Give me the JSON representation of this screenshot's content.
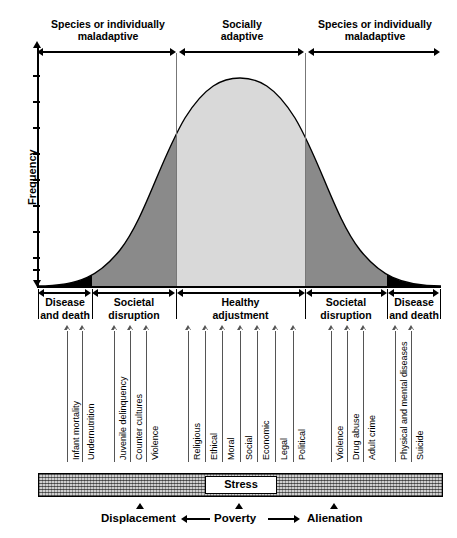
{
  "figure": {
    "y_axis_label": "Frequency",
    "y_tick_count": 9
  },
  "top_regions": [
    {
      "label_line1": "Species or individually",
      "label_line2": "maladaptive",
      "x_start": 38,
      "x_end": 176
    },
    {
      "label_line1": "Socially",
      "label_line2": "adaptive",
      "x_start": 178,
      "x_end": 305
    },
    {
      "label_line1": "Species or individually",
      "label_line2": "maladaptive",
      "x_start": 307,
      "x_end": 441
    }
  ],
  "bottom_bands": [
    {
      "label_line1": "Disease",
      "label_line2": "and death",
      "x_start": 38,
      "x_end": 92,
      "shade": "#000000"
    },
    {
      "label_line1": "Societal",
      "label_line2": "disruption",
      "x_start": 92,
      "x_end": 176,
      "shade": "#8a8a8a"
    },
    {
      "label_line1": "Healthy",
      "label_line2": "adjustment",
      "x_start": 176,
      "x_end": 305,
      "shade": "#d9d9d9"
    },
    {
      "label_line1": "Societal",
      "label_line2": "disruption",
      "x_start": 305,
      "x_end": 387,
      "shade": "#8a8a8a"
    },
    {
      "label_line1": "Disease",
      "label_line2": "and death",
      "x_start": 387,
      "x_end": 441,
      "shade": "#000000"
    }
  ],
  "callouts": {
    "left": [
      {
        "label": "Infant mortality",
        "x": 67,
        "line_top": 331,
        "line_bottom": 462
      },
      {
        "label": "Undernutrition",
        "x": 82,
        "line_top": 331,
        "line_bottom": 462
      },
      {
        "label": "Juvenile delinquency",
        "x": 114,
        "line_top": 331,
        "line_bottom": 462
      },
      {
        "label": "Counter cultures",
        "x": 130,
        "line_top": 331,
        "line_bottom": 462
      },
      {
        "label": "Violence",
        "x": 146,
        "line_top": 331,
        "line_bottom": 462
      }
    ],
    "center": [
      {
        "label": "Religious",
        "x": 188,
        "line_top": 331,
        "line_bottom": 462
      },
      {
        "label": "Ethical",
        "x": 205,
        "line_top": 331,
        "line_bottom": 462
      },
      {
        "label": "Moral",
        "x": 222,
        "line_top": 331,
        "line_bottom": 462
      },
      {
        "label": "Social",
        "x": 240,
        "line_top": 331,
        "line_bottom": 462
      },
      {
        "label": "Economic",
        "x": 257,
        "line_top": 331,
        "line_bottom": 462
      },
      {
        "label": "Legal",
        "x": 275,
        "line_top": 331,
        "line_bottom": 462
      },
      {
        "label": "Political",
        "x": 293,
        "line_top": 331,
        "line_bottom": 462
      }
    ],
    "right": [
      {
        "label": "Violence",
        "x": 331,
        "line_top": 331,
        "line_bottom": 462
      },
      {
        "label": "Drug abuse",
        "x": 347,
        "line_top": 331,
        "line_bottom": 462
      },
      {
        "label": "Adult crime",
        "x": 363,
        "line_top": 331,
        "line_bottom": 462
      },
      {
        "label": "Physical and mental diseases",
        "x": 395,
        "line_top": 331,
        "line_bottom": 462
      },
      {
        "label": "Suicide",
        "x": 411,
        "line_top": 331,
        "line_bottom": 462
      }
    ]
  },
  "stress_bar": {
    "label": "Stress",
    "x_start": 38,
    "x_end": 441
  },
  "bottom_axis": {
    "left_word": "Displacement",
    "center_word": "Poverty",
    "right_word": "Alienation"
  },
  "chart_data": {
    "type": "area",
    "title": "",
    "xlabel": "",
    "ylabel": "Frequency",
    "distribution": "normal bell curve",
    "peak_x": 240,
    "curve_shading_boundaries": [
      38,
      92,
      176,
      305,
      387,
      441
    ],
    "shade_colors": [
      "#000000",
      "#8a8a8a",
      "#d9d9d9",
      "#8a8a8a",
      "#000000"
    ],
    "axis_x_range": [
      38,
      441
    ],
    "axis_y_range": [
      78,
      285
    ],
    "grid": false,
    "legend": "none"
  },
  "colors": {
    "black_band": "#000000",
    "dark_gray_band": "#8a8a8a",
    "light_gray_band": "#d9d9d9",
    "outline": "#000000"
  }
}
